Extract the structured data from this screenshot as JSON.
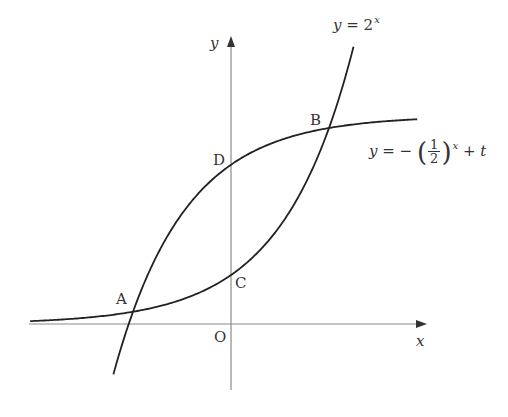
{
  "figure": {
    "origin_px": [
      231,
      324
    ],
    "unit_px": 49,
    "t_value": 4.25,
    "axes": {
      "x_label": "x",
      "y_label": "y",
      "origin_label": "O",
      "x_range_px": [
        29,
        426
      ],
      "y_range_px": [
        390,
        36
      ]
    },
    "curves": [
      {
        "name": "exp-2x",
        "label_lhs": "y =",
        "label_base": "2",
        "label_exp": "x",
        "x_from": -4.1,
        "x_to": 2.5
      },
      {
        "name": "neg-half-x-plus-t",
        "label_lhs": "y = −",
        "label_num": "1",
        "label_den": "2",
        "label_exp": "x",
        "label_tail": "+ t",
        "x_from": -2.4,
        "x_to": 3.8
      }
    ],
    "points": [
      {
        "name": "A",
        "label": "A"
      },
      {
        "name": "B",
        "label": "B"
      },
      {
        "name": "C",
        "label": "C"
      },
      {
        "name": "D",
        "label": "D"
      }
    ]
  }
}
